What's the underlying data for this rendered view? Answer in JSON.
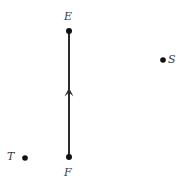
{
  "figure": {
    "type": "geometry-diagram",
    "width": 189,
    "height": 185,
    "background_color": "#ffffff",
    "stroke_color": "#2b2b2b",
    "label_color": "#3a3a3a"
  },
  "labels": {
    "E": "E",
    "F": "F",
    "S": "S",
    "T": "T"
  },
  "chart_data": {
    "type": "scatter",
    "title": "",
    "xlabel": "",
    "ylabel": "",
    "xlim": [
      0,
      189
    ],
    "ylim": [
      0,
      185
    ],
    "grid": false,
    "legend": "none",
    "points": [
      {
        "name": "E",
        "x": 69,
        "y": 31,
        "label": "E",
        "label_position": "above",
        "radius": 3
      },
      {
        "name": "F",
        "x": 69,
        "y": 157,
        "label": "F",
        "label_position": "below",
        "radius": 3
      },
      {
        "name": "S",
        "x": 163,
        "y": 60,
        "label": "S",
        "label_position": "right",
        "radius": 2.8
      },
      {
        "name": "T",
        "x": 25,
        "y": 158,
        "label": "T",
        "label_position": "left",
        "radius": 2.8
      }
    ],
    "segments": [
      {
        "name": "ray-F-to-E",
        "from": "F",
        "to": "E",
        "x1": 69,
        "y1": 157,
        "x2": 69,
        "y2": 31,
        "arrow": "midpoint-toward-E",
        "arrow_x": 69,
        "arrow_y": 88,
        "arrow_width": 9,
        "arrow_height": 8,
        "stroke_width": 1.1
      }
    ],
    "annotations": []
  }
}
